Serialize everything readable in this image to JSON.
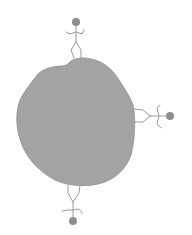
{
  "diagram": {
    "colors": {
      "background": "#ffffff",
      "blob_fill": "#a3a3a3",
      "blob_edge": "#8f8f8f",
      "figure_stroke": "#9a9a9a",
      "head_fill": "#8e8e8e"
    },
    "blob": {
      "label": "planet"
    },
    "figures": [
      {
        "id": "top",
        "position": "top",
        "orientation": "upright",
        "head": [
          76,
          22
        ]
      },
      {
        "id": "right",
        "position": "right",
        "orientation": "sideways",
        "head": [
          170,
          116
        ]
      },
      {
        "id": "bottom",
        "position": "bottom",
        "orientation": "upside-down",
        "head": [
          73,
          221
        ]
      }
    ]
  }
}
